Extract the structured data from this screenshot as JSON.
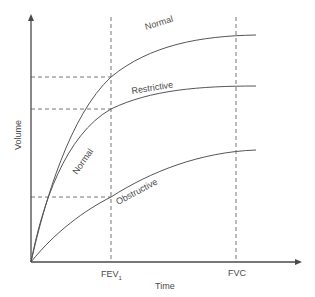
{
  "diagram": {
    "axes": {
      "x_label": "Time",
      "y_label": "Volume",
      "x_ticks": [
        {
          "label": "FEV",
          "subscript": "1",
          "x": 111
        },
        {
          "label": "FVC",
          "subscript": "",
          "x": 236
        }
      ]
    },
    "curves": [
      {
        "name": "Normal",
        "label_top": "Normal",
        "label_bottom": "Normal"
      },
      {
        "name": "Restrictive",
        "label": "Restrictive"
      },
      {
        "name": "Obstructive",
        "label": "Obstructive"
      }
    ],
    "colors": {
      "axis": "#4a4a4a",
      "curve": "#555555",
      "dashed": "#666666",
      "text": "#4a4a4a"
    }
  }
}
